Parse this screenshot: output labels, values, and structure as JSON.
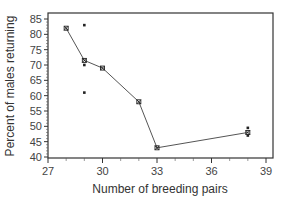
{
  "chart_data": {
    "type": "line",
    "title": "",
    "xlabel": "Number of breeding pairs",
    "ylabel": "Percent of males returning",
    "xlim": [
      27,
      39
    ],
    "ylim": [
      40,
      85
    ],
    "xticks": [
      27,
      30,
      33,
      36,
      39
    ],
    "yticks": [
      40,
      45,
      50,
      55,
      60,
      65,
      70,
      75,
      80,
      85
    ],
    "grid": false,
    "legend": null,
    "series": [
      {
        "name": "Mean",
        "kind": "line",
        "marker": "x",
        "x": [
          28,
          29,
          30,
          32,
          33,
          38
        ],
        "y": [
          82,
          71.5,
          69,
          58,
          43,
          48
        ]
      },
      {
        "name": "Individual observations",
        "kind": "scatter",
        "marker": "dot",
        "x": [
          29,
          29,
          29,
          38,
          38
        ],
        "y": [
          83,
          70,
          61,
          49.5,
          47
        ]
      }
    ],
    "colors": {
      "line": "#555555",
      "marker": "#222222",
      "axis": "#333333"
    }
  }
}
